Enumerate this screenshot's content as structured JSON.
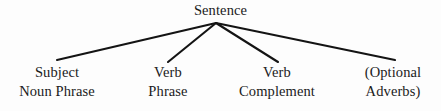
{
  "diagram": {
    "type": "syntax-tree",
    "title": "Sentence",
    "background_color": "#fdfdfd",
    "line_color": "#141414",
    "text_color": "#1b1b1b",
    "root": {
      "label": "Sentence",
      "x": 216,
      "y": 12
    },
    "apex": {
      "x": 216,
      "y": 23
    },
    "children": [
      {
        "name": "subject-noun-phrase",
        "line1": "Subject",
        "line2": "Noun Phrase",
        "x": 57,
        "branch_end_x": 57,
        "branch_end_y": 60
      },
      {
        "name": "verb-phrase",
        "line1": "Verb",
        "line2": "Phrase",
        "x": 168,
        "branch_end_x": 168,
        "branch_end_y": 62
      },
      {
        "name": "verb-complement",
        "line1": "Verb",
        "line2": "Complement",
        "x": 277,
        "branch_end_x": 278,
        "branch_end_y": 62
      },
      {
        "name": "optional-adverbs",
        "line1": "(Optional",
        "line2": "Adverbs)",
        "x": 393,
        "branch_end_x": 395,
        "branch_end_y": 60
      }
    ]
  }
}
